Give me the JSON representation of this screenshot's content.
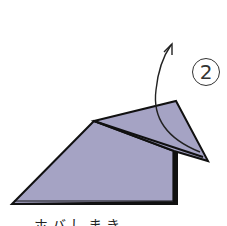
{
  "diagram": {
    "step_number": "2",
    "caption": "ホバしまき",
    "colors": {
      "paper_fill": "#a5a3c4",
      "outline": "#111111",
      "background": "#ffffff"
    },
    "elements": {
      "paper_body": "Folded paper body (trapezoid shape)",
      "flap": "Triangular flap to be folded up",
      "arrow": "Curved fold arrow pointing upward"
    }
  }
}
